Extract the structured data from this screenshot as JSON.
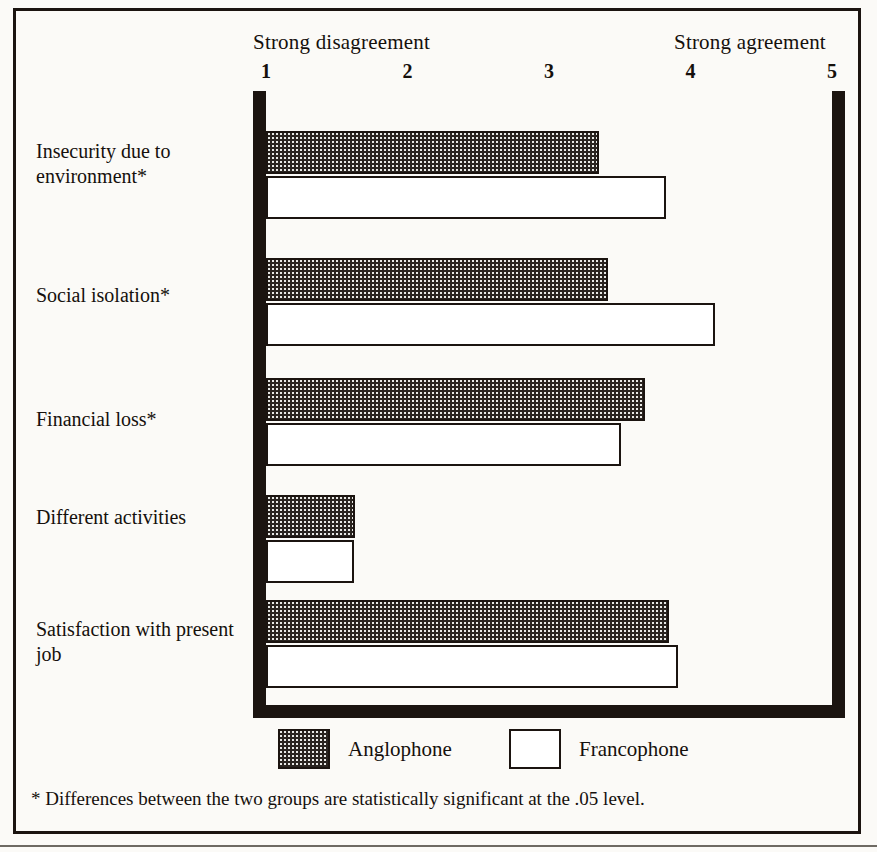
{
  "axis": {
    "left_label": "Strong disagreement",
    "right_label": "Strong agreement",
    "ticks": [
      "1",
      "2",
      "3",
      "4",
      "5"
    ],
    "min": 1,
    "max": 5
  },
  "legend": {
    "items": [
      {
        "key": "anglophone",
        "label": "Anglophone",
        "style": "stippled"
      },
      {
        "key": "francophone",
        "label": "Francophone",
        "style": "open"
      }
    ]
  },
  "footnote": "* Differences between the two groups are statistically significant at the .05 level.",
  "colors": {
    "ink": "#1b1410",
    "paper": "#fbfaf7",
    "stipple_fill": "#e9e9e6",
    "stipple_dot": "#2a2420",
    "open_fill": "#ffffff"
  },
  "categories": [
    {
      "label": "Insecurity due\nto environment*",
      "significant": true
    },
    {
      "label": "Social isolation*",
      "significant": true
    },
    {
      "label": "Financial loss*",
      "significant": true
    },
    {
      "label": "Different activities",
      "significant": false
    },
    {
      "label": "Satisfaction with\npresent job",
      "significant": false
    }
  ],
  "chart_data": {
    "type": "bar",
    "orientation": "horizontal",
    "title": "",
    "subtitle": "",
    "xlabel": "",
    "ylabel": "",
    "xlim": [
      1,
      5
    ],
    "xticks": [
      1,
      2,
      3,
      4,
      5
    ],
    "xtick_labels": [
      "1",
      "2",
      "3",
      "4",
      "5"
    ],
    "x_axis_endpoints": [
      "Strong disagreement",
      "Strong agreement"
    ],
    "grid": false,
    "legend_position": "bottom",
    "categories": [
      "Insecurity due to environment*",
      "Social isolation*",
      "Financial loss*",
      "Different activities",
      "Satisfaction with present job"
    ],
    "series": [
      {
        "name": "Anglophone",
        "values": [
          3.35,
          3.42,
          3.68,
          1.63,
          3.85
        ]
      },
      {
        "name": "Francophone",
        "values": [
          3.83,
          4.17,
          3.51,
          1.62,
          3.91
        ]
      }
    ],
    "notes": "* Differences between the two groups are statistically significant at the .05 level."
  }
}
